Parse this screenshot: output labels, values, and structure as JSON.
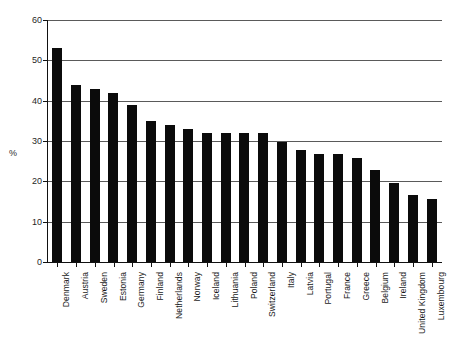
{
  "chart_data": {
    "type": "bar",
    "title": "",
    "subtitle": "",
    "xlabel": "",
    "ylabel": "%",
    "ylim": [
      0,
      60
    ],
    "yticks": [
      0,
      10,
      20,
      30,
      40,
      50,
      60
    ],
    "grid": true,
    "legend": false,
    "legend_position": "none",
    "orientation": "vertical",
    "bar_color": "#0b0b0b",
    "categories": [
      "Denmark",
      "Austria",
      "Sweden",
      "Estonia",
      "Germany",
      "Finland",
      "Netherlands",
      "Norway",
      "Iceland",
      "Lithuania",
      "Poland",
      "Switzerland",
      "Italy",
      "Latvia",
      "Portugal",
      "France",
      "Greece",
      "Belgium",
      "Ireland",
      "United Kingdom",
      "Luxembourg"
    ],
    "values": [
      53.0,
      44.0,
      43.0,
      42.0,
      39.0,
      35.0,
      34.0,
      33.0,
      32.0,
      32.0,
      32.0,
      32.0,
      29.7,
      27.8,
      26.8,
      26.8,
      25.8,
      22.8,
      19.7,
      16.7,
      15.7
    ]
  },
  "axes": {
    "y_title": "%",
    "y_tick_labels": [
      "60",
      "50",
      "40",
      "30",
      "20",
      "10",
      "0"
    ]
  }
}
